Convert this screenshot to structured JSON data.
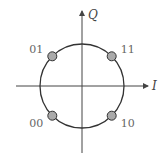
{
  "diagram": {
    "type": "constellation",
    "axes": {
      "horizontal": "I",
      "vertical": "Q"
    },
    "points": [
      {
        "label": "01",
        "quadrant": "top-left",
        "angle_deg": 135
      },
      {
        "label": "11",
        "quadrant": "top-right",
        "angle_deg": 45
      },
      {
        "label": "00",
        "quadrant": "bottom-left",
        "angle_deg": 225
      },
      {
        "label": "10",
        "quadrant": "bottom-right",
        "angle_deg": 315
      }
    ],
    "colors": {
      "line": "#333333",
      "point_fill": "#aaaaaa",
      "label": "#666666"
    }
  }
}
